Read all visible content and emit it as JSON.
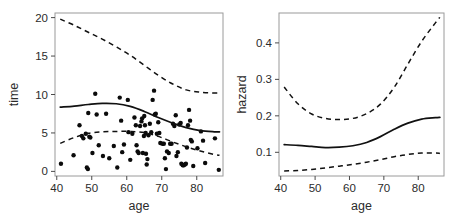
{
  "figure": {
    "background": "#ffffff",
    "ink_color": "#111111",
    "frame_color": "#9a9a9a",
    "width": 470,
    "height": 217
  },
  "chart_data": [
    {
      "type": "scatter",
      "panel": "left",
      "title": "",
      "xlabel": "age",
      "ylabel": "time",
      "xlim": [
        39.5,
        87.5
      ],
      "ylim": [
        -0.6,
        20.6
      ],
      "xticks": [
        40,
        50,
        60,
        70,
        80
      ],
      "xticklabels": [
        "40",
        "50",
        "60",
        "70",
        "80"
      ],
      "yticks": [
        0,
        5,
        10,
        15,
        20
      ],
      "yticklabels": [
        "0",
        "5",
        "10",
        "15",
        "20"
      ],
      "grid": false,
      "legend": "none",
      "points": [
        [
          41.2,
          1.0
        ],
        [
          44.8,
          2.1
        ],
        [
          46.5,
          6.0
        ],
        [
          47.2,
          4.6
        ],
        [
          47.6,
          4.3
        ],
        [
          48.3,
          4.9
        ],
        [
          48.6,
          0.5
        ],
        [
          48.9,
          0.3
        ],
        [
          49.0,
          7.6
        ],
        [
          49.3,
          4.5
        ],
        [
          49.6,
          4.4
        ],
        [
          50.2,
          2.4
        ],
        [
          51.0,
          10.1
        ],
        [
          51.4,
          7.4
        ],
        [
          52.0,
          3.4
        ],
        [
          53.2,
          2.0
        ],
        [
          54.1,
          7.5
        ],
        [
          55.0,
          1.7
        ],
        [
          56.3,
          3.3
        ],
        [
          57.3,
          0.5
        ],
        [
          58.0,
          9.6
        ],
        [
          58.4,
          6.6
        ],
        [
          58.7,
          2.5
        ],
        [
          59.2,
          3.5
        ],
        [
          60.3,
          9.3
        ],
        [
          60.5,
          5.1
        ],
        [
          61.0,
          1.5
        ],
        [
          61.6,
          4.9
        ],
        [
          62.2,
          7.0
        ],
        [
          62.6,
          6.0
        ],
        [
          62.8,
          3.4
        ],
        [
          63.1,
          2.6
        ],
        [
          63.4,
          2.4
        ],
        [
          63.8,
          5.9
        ],
        [
          64.2,
          6.5
        ],
        [
          64.4,
          6.9
        ],
        [
          64.6,
          2.4
        ],
        [
          64.9,
          4.6
        ],
        [
          65.0,
          7.2
        ],
        [
          65.2,
          6.0
        ],
        [
          65.4,
          5.0
        ],
        [
          65.5,
          2.3
        ],
        [
          65.7,
          0.9
        ],
        [
          65.9,
          1.6
        ],
        [
          66.2,
          4.7
        ],
        [
          66.6,
          6.2
        ],
        [
          67.0,
          5.1
        ],
        [
          67.4,
          9.3
        ],
        [
          67.8,
          10.5
        ],
        [
          68.0,
          7.4
        ],
        [
          68.3,
          7.5
        ],
        [
          68.6,
          4.9
        ],
        [
          69.0,
          6.4
        ],
        [
          69.3,
          5.0
        ],
        [
          69.6,
          3.7
        ],
        [
          70.2,
          3.6
        ],
        [
          70.6,
          3.6
        ],
        [
          70.9,
          1.7
        ],
        [
          71.2,
          0.3
        ],
        [
          71.5,
          2.6
        ],
        [
          72.0,
          2.4
        ],
        [
          72.4,
          3.6
        ],
        [
          72.8,
          3.6
        ],
        [
          73.2,
          6.2
        ],
        [
          73.6,
          5.9
        ],
        [
          74.0,
          7.3
        ],
        [
          74.2,
          2.0
        ],
        [
          74.6,
          2.5
        ],
        [
          75.0,
          6.1
        ],
        [
          75.4,
          6.3
        ],
        [
          75.6,
          1.0
        ],
        [
          76.0,
          0.8
        ],
        [
          76.3,
          0.8
        ],
        [
          76.6,
          0.9
        ],
        [
          76.9,
          1.0
        ],
        [
          77.2,
          3.1
        ],
        [
          77.5,
          6.0
        ],
        [
          77.8,
          8.0
        ],
        [
          78.1,
          6.6
        ],
        [
          78.3,
          4.1
        ],
        [
          78.6,
          3.9
        ],
        [
          79.0,
          0.7
        ],
        [
          80.2,
          3.0
        ],
        [
          81.2,
          5.2
        ],
        [
          81.8,
          4.0
        ],
        [
          82.4,
          1.1
        ],
        [
          85.2,
          4.3
        ],
        [
          86.3,
          0.2
        ]
      ],
      "series": [
        {
          "name": "fitted-median",
          "style": "solid",
          "x": [
            41,
            45,
            49,
            53,
            57,
            61,
            65,
            69,
            73,
            77,
            81,
            85,
            86.5
          ],
          "y": [
            8.35,
            8.5,
            8.7,
            8.85,
            8.8,
            8.45,
            7.8,
            7.0,
            6.3,
            5.7,
            5.3,
            5.15,
            5.15
          ]
        },
        {
          "name": "upper-band",
          "style": "dashed",
          "x": [
            41,
            45,
            49,
            53,
            57,
            61,
            65,
            69,
            73,
            77,
            81,
            85,
            86.5
          ],
          "y": [
            19.8,
            19.0,
            18.1,
            17.2,
            16.2,
            15.1,
            13.8,
            12.5,
            11.4,
            10.6,
            10.3,
            10.2,
            10.2
          ]
        },
        {
          "name": "lower-band",
          "style": "dashed",
          "x": [
            41,
            45,
            49,
            53,
            57,
            61,
            65,
            69,
            73,
            77,
            81,
            85,
            86.5
          ],
          "y": [
            3.65,
            4.4,
            4.95,
            5.15,
            5.2,
            5.2,
            5.05,
            4.55,
            3.85,
            3.2,
            2.65,
            2.2,
            2.1
          ]
        }
      ]
    },
    {
      "type": "line",
      "panel": "right",
      "title": "",
      "xlabel": "age",
      "ylabel": "hazard",
      "xlim": [
        39.5,
        87.5
      ],
      "ylim": [
        0.035,
        0.482
      ],
      "xticks": [
        40,
        50,
        60,
        70,
        80
      ],
      "xticklabels": [
        "40",
        "50",
        "60",
        "70",
        "80"
      ],
      "yticks": [
        0.1,
        0.2,
        0.3,
        0.4
      ],
      "yticklabels": [
        "0.1",
        "0.2",
        "0.3",
        "0.4"
      ],
      "grid": false,
      "legend": "none",
      "series": [
        {
          "name": "hazard-estimate",
          "style": "solid",
          "x": [
            41,
            45,
            49,
            53,
            57,
            61,
            65,
            69,
            73,
            77,
            81,
            85,
            86.3
          ],
          "y": [
            0.121,
            0.119,
            0.116,
            0.113,
            0.114,
            0.118,
            0.127,
            0.143,
            0.163,
            0.18,
            0.191,
            0.195,
            0.196
          ]
        },
        {
          "name": "hazard-upper-band",
          "style": "dashed",
          "x": [
            41,
            45,
            49,
            53,
            57,
            61,
            65,
            69,
            73,
            77,
            81,
            85,
            86.3
          ],
          "y": [
            0.279,
            0.233,
            0.205,
            0.193,
            0.19,
            0.193,
            0.206,
            0.232,
            0.278,
            0.342,
            0.404,
            0.455,
            0.47
          ]
        },
        {
          "name": "hazard-lower-band",
          "style": "dashed",
          "x": [
            41,
            45,
            49,
            53,
            57,
            61,
            65,
            69,
            73,
            77,
            81,
            85,
            86.3
          ],
          "y": [
            0.049,
            0.05,
            0.053,
            0.057,
            0.062,
            0.067,
            0.073,
            0.08,
            0.088,
            0.094,
            0.098,
            0.098,
            0.097
          ]
        }
      ]
    }
  ]
}
